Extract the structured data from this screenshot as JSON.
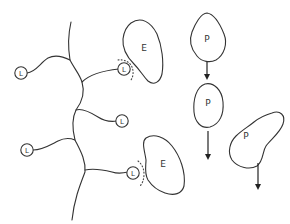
{
  "diagram": {
    "type": "schematic",
    "colors": {
      "stroke": "#333333",
      "background": "#ffffff"
    },
    "nodes": {
      "l_nodes": [
        {
          "id": "L1",
          "label": "L"
        },
        {
          "id": "L2",
          "label": "L"
        },
        {
          "id": "L3",
          "label": "L"
        },
        {
          "id": "L4",
          "label": "L"
        },
        {
          "id": "L5",
          "label": "L"
        }
      ],
      "e_bodies": [
        {
          "id": "E1",
          "label": "E",
          "adjacent_to": "L2"
        },
        {
          "id": "E2",
          "label": "E",
          "adjacent_to": "L5"
        }
      ],
      "p_bodies": [
        {
          "id": "P1",
          "label": "P",
          "arrow": "down"
        },
        {
          "id": "P2",
          "label": "P",
          "arrow": "down"
        },
        {
          "id": "P3",
          "label": "P",
          "arrow": "down"
        }
      ]
    }
  }
}
